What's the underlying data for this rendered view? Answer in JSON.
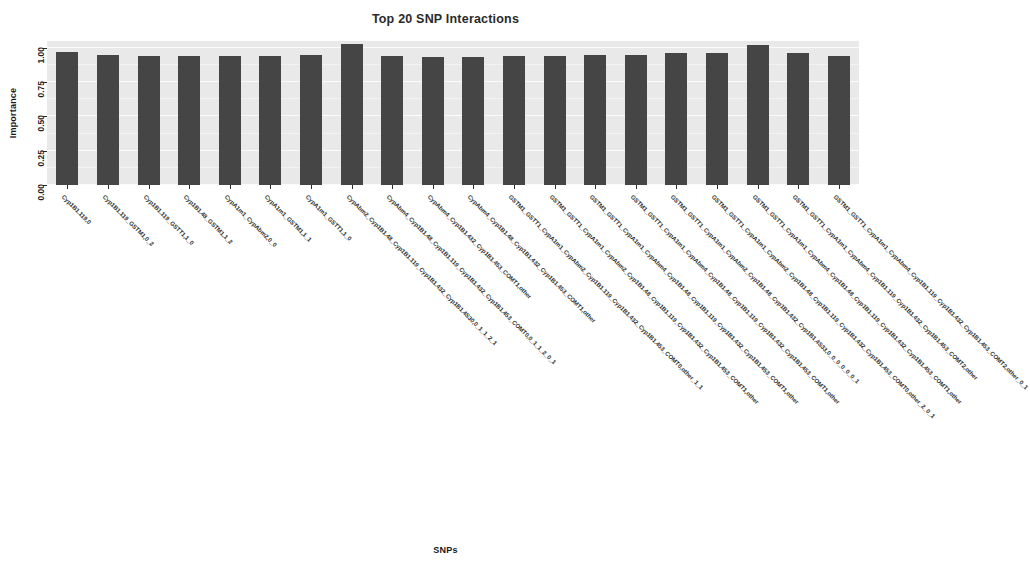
{
  "chart_data": {
    "type": "bar",
    "title": "Top 20 SNP Interactions",
    "xlabel": "SNPs",
    "ylabel": "Importance",
    "ylim": [
      0.0,
      1.05
    ],
    "ytick_labels": [
      "0.00",
      "0.25",
      "0.50",
      "0.75",
      "1.00"
    ],
    "ytick_values": [
      0.0,
      0.25,
      0.5,
      0.75,
      1.0
    ],
    "grid": true,
    "legend": null,
    "bar_color": "#454545",
    "panel_color": "#e9e9e9",
    "categories": [
      "Cyp1B1.119,0",
      "Cyp1B1.119_GSTM1,0_2",
      "Cyp1B1.119_GSTT1,1_0",
      "Cyp1B1.48_GSTM1,1_2",
      "CypA1m1_CypAbm2,0_0",
      "CypA1m1_GSTM1,1_1",
      "CypA1m1_GSTT1,1_0",
      "CypAbm2_Cyp1B1.48_Cyp1B1.119_Cyp1B1.432_Cyp1B1.4S30,0_1_1_2_1",
      "CypAbm4_Cyp1B1.48_Cyp1B1.119_Cyp1B1.432_Cyp1B1.453_COMT0,0_1_1_2_0_1",
      "CypAbm4_Cyp1B1.432_Cyp1B1.453_COMT1,other",
      "CypAbm4_Cyp1B1.48_Cyp1B1.432_Cyp1B1.453_COMT1,other",
      "GSTM1_GSTT1_CypA1m1_CypAbm2_Cyp1B1.119_Cyp1B1.432_Cyp1B1.453_COMT0,other_1_1",
      "GSTM1_GSTT1_CypA1m1_CypAbm2_Cyp1B1.48_Cyp1B1.119_Cyp1B1.432_Cyp1B1.453_COMT1,other",
      "GSTM1_GSTT1_CypA1m1_CypAbm4_Cyp1B1.48_Cyp1B1.119_Cyp1B1.432_Cyp1B1.453_COMT1,other",
      "GSTM1_GSTT1_CypA1m1_CypAbm4_Cyp1B1.48_Cyp1B1.119_Cyp1B1.432_Cyp1B1.453_COMT1,other",
      "GSTM1_GSTT1_CypA1m1_CypAbm2_Cyp1B1.48_Cyp1B1.432_Cyp1B1.4S33,0_0_0_0_0_0_1",
      "GSTM1_GSTT1_CypA1m1_CypAbm2_Cyp1B1.48_Cyp1B1.119_Cyp1B1.432_Cyp1B1.453_COMT0,other_2_0_1",
      "GSTM1_GSTT1_CypA1m1_CypAbm4_Cyp1B1.48_Cyp1B1.119_Cyp1B1.432_Cyp1B1.453_COMT1,other",
      "GSTM1_GSTT1_CypA1m1_CypAbm4_Cyp1B1.119_Cyp1B1.432_Cyp1B1.453_COMT2,other",
      "GSTM1_GSTT1_CypA1m1_CypAbm4_Cyp1B1.119_Cyp1B1.432_Cyp1B1.453_COMT2,other_0_1"
    ],
    "values": [
      0.97,
      0.95,
      0.94,
      0.94,
      0.94,
      0.94,
      0.95,
      1.03,
      0.94,
      0.93,
      0.93,
      0.94,
      0.94,
      0.95,
      0.95,
      0.96,
      0.96,
      1.02,
      0.96,
      0.94
    ]
  }
}
